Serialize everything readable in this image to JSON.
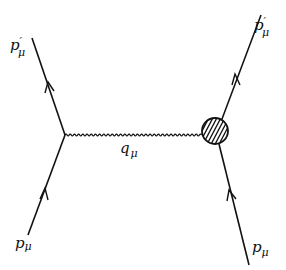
{
  "diagram": {
    "type": "feynman",
    "colors": {
      "line": "#111111",
      "background": "#ffffff"
    },
    "nodes": [
      {
        "id": "left-vertex",
        "kind": "point-vertex",
        "x": 65,
        "y": 135
      },
      {
        "id": "hadron-blob",
        "kind": "form-factor-blob",
        "x": 215,
        "y": 131,
        "r": 13,
        "fill": "hatched"
      }
    ],
    "edges": [
      {
        "id": "incoming-left",
        "kind": "fermion",
        "from": [
          28,
          235
        ],
        "to": [
          65,
          135
        ],
        "label": {
          "base": "p",
          "prime": "",
          "sub": "μ"
        }
      },
      {
        "id": "outgoing-left",
        "kind": "fermion",
        "from": [
          65,
          135
        ],
        "to": [
          32,
          38
        ],
        "label": {
          "base": "p",
          "prime": "′",
          "sub": "μ"
        }
      },
      {
        "id": "photon",
        "kind": "photon",
        "from": [
          65,
          135
        ],
        "to": [
          202,
          135
        ],
        "label": {
          "base": "q",
          "prime": "",
          "sub": "μ"
        }
      },
      {
        "id": "incoming-right",
        "kind": "fermion",
        "from": [
          249,
          265
        ],
        "to": [
          219,
          144
        ],
        "label": {
          "base": "p",
          "prime": "",
          "sub": "μ"
        }
      },
      {
        "id": "outgoing-right",
        "kind": "fermion",
        "from": [
          222,
          119
        ],
        "to": [
          261,
          15
        ],
        "label": {
          "base": "p",
          "prime": "′",
          "sub": "μ"
        }
      }
    ],
    "labels": {
      "top_left": {
        "base": "p",
        "prime": "′",
        "sub": "μ"
      },
      "bottom_left": {
        "base": "p",
        "prime": "",
        "sub": "μ"
      },
      "photon": {
        "base": "q",
        "prime": "",
        "sub": "μ"
      },
      "top_right": {
        "base": "p",
        "prime": "′",
        "sub": "μ"
      },
      "bottom_right": {
        "base": "p",
        "prime": "",
        "sub": "μ"
      }
    }
  }
}
